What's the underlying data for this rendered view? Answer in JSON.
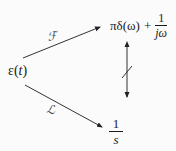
{
  "diagram": {
    "source": {
      "symbol": "ε",
      "open": "(",
      "variable": "t",
      "close": ")"
    },
    "fourier": {
      "operator_label": "ℱ",
      "term1": "πδ(ω)",
      "plus": "+",
      "fraction": {
        "numerator": "1",
        "denominator": "jω"
      }
    },
    "laplace": {
      "operator_label": "ℒ",
      "fraction": {
        "numerator": "1",
        "denominator": "s"
      }
    },
    "relation": {
      "type": "bidirectional-arrow-struck",
      "meaning": "not directly interchangeable"
    },
    "edges": [
      {
        "from": "ε(t)",
        "to": "πδ(ω) + 1/jω",
        "label": "ℱ"
      },
      {
        "from": "ε(t)",
        "to": "1/s",
        "label": "ℒ"
      },
      {
        "from": "πδ(ω) + 1/jω",
        "to": "1/s",
        "label": "≠ (struck double arrow)"
      }
    ],
    "colors": {
      "ink": "#1a1a1a",
      "label": "#444444",
      "background": "#fbfbfb"
    }
  }
}
